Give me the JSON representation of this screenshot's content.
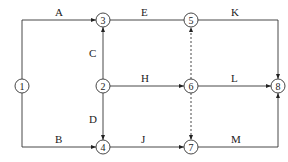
{
  "diagram": {
    "type": "activity-on-arrow network",
    "nodes": [
      {
        "id": "1",
        "x": 22,
        "y": 86
      },
      {
        "id": "2",
        "x": 103,
        "y": 86
      },
      {
        "id": "3",
        "x": 103,
        "y": 20
      },
      {
        "id": "4",
        "x": 103,
        "y": 147
      },
      {
        "id": "5",
        "x": 191,
        "y": 20
      },
      {
        "id": "6",
        "x": 191,
        "y": 86
      },
      {
        "id": "7",
        "x": 191,
        "y": 147
      },
      {
        "id": "8",
        "x": 278,
        "y": 86
      }
    ],
    "activities": [
      {
        "label": "A",
        "from": "1",
        "to": "3",
        "dashed": false
      },
      {
        "label": "B",
        "from": "1",
        "to": "4",
        "dashed": false
      },
      {
        "label": "C",
        "from": "2",
        "to": "3",
        "dashed": false
      },
      {
        "label": "D",
        "from": "2",
        "to": "4",
        "dashed": false
      },
      {
        "label": "E",
        "from": "3",
        "to": "5",
        "dashed": false
      },
      {
        "label": "H",
        "from": "2",
        "to": "6",
        "dashed": false
      },
      {
        "label": "J",
        "from": "4",
        "to": "7",
        "dashed": false
      },
      {
        "label": "K",
        "from": "5",
        "to": "8",
        "dashed": false
      },
      {
        "label": "L",
        "from": "6",
        "to": "8",
        "dashed": false
      },
      {
        "label": "M",
        "from": "7",
        "to": "8",
        "dashed": false
      },
      {
        "label": "",
        "from": "6",
        "to": "5",
        "dashed": true
      },
      {
        "label": "",
        "from": "6",
        "to": "7",
        "dashed": true
      }
    ]
  }
}
